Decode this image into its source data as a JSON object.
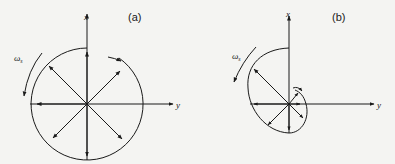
{
  "figure": {
    "panel_a": {
      "label": "(a)",
      "x_axis": "x",
      "y_axis": "y",
      "omega_symbol": "ω",
      "omega_sub": "s"
    },
    "panel_b": {
      "label": "(b)",
      "x_axis": "x",
      "y_axis": "y",
      "omega_symbol": "ω",
      "omega_sub": "s"
    },
    "colors": {
      "ink": "#1a1a1a",
      "paper": "#f4f4f2"
    }
  }
}
